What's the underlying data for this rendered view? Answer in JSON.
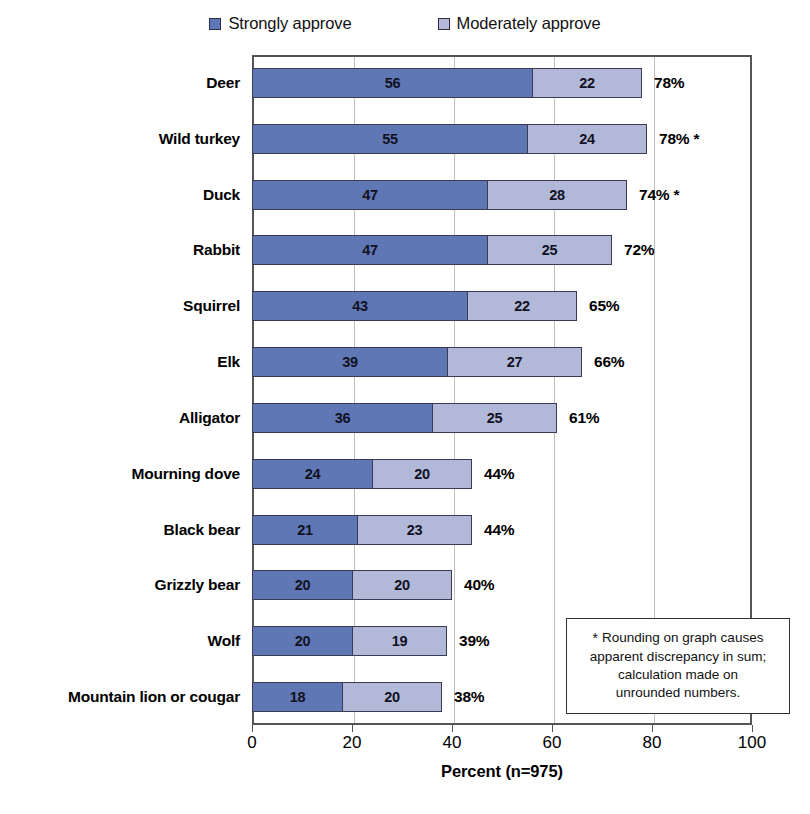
{
  "chart_data": {
    "type": "bar",
    "orientation": "horizontal",
    "stacked": true,
    "title": "",
    "xlabel": "Percent (n=975)",
    "ylabel": "",
    "xlim": [
      0,
      100
    ],
    "xticks": [
      0,
      20,
      40,
      60,
      80,
      100
    ],
    "xtick_labels": [
      "0",
      "20",
      "40",
      "60",
      "80",
      "100"
    ],
    "grid": "vertical",
    "legend_position": "top-center",
    "categories": [
      "Deer",
      "Wild turkey",
      "Duck",
      "Rabbit",
      "Squirrel",
      "Elk",
      "Alligator",
      "Mourning dove",
      "Black bear",
      "Grizzly bear",
      "Wolf",
      "Mountain lion or cougar"
    ],
    "series": [
      {
        "name": "Strongly approve",
        "color": "#5f77b5",
        "values": [
          56,
          55,
          47,
          47,
          43,
          39,
          36,
          24,
          21,
          20,
          20,
          18
        ]
      },
      {
        "name": "Moderately approve",
        "color": "#b2b8d8",
        "values": [
          22,
          24,
          28,
          25,
          22,
          27,
          25,
          20,
          23,
          20,
          19,
          20
        ]
      }
    ],
    "totals": [
      "78%",
      "78% *",
      "74% *",
      "72%",
      "65%",
      "66%",
      "61%",
      "44%",
      "44%",
      "40%",
      "39%",
      "38%"
    ],
    "annotations": [
      {
        "marker": "*",
        "text": "Rounding on graph causes apparent discrepancy in sum; calculation made on unrounded numbers."
      }
    ]
  },
  "legend": {
    "items": [
      {
        "label": "Strongly approve",
        "color": "#5f77b5"
      },
      {
        "label": "Moderately approve",
        "color": "#b2b8d8"
      }
    ]
  },
  "footnote": {
    "star": "*",
    "line1": "Rounding on graph causes",
    "line2": "apparent discrepancy in sum;",
    "line3": "calculation made on",
    "line4": "unrounded numbers."
  },
  "axis": {
    "x_title": "Percent (n=975)"
  }
}
